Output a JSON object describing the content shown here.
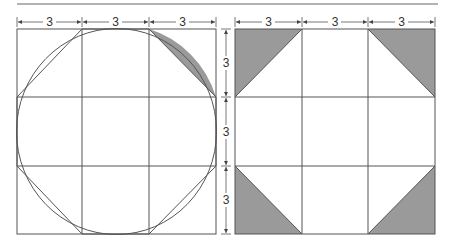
{
  "figure": {
    "colors": {
      "line": "#555555",
      "shade": "#9a9a9a",
      "background": "#ffffff"
    },
    "left_panel": {
      "top_dimensions": [
        "3",
        "3",
        "3"
      ],
      "shaded_region": "circular segment between arc and chord in top-right cell"
    },
    "right_panel": {
      "top_dimensions": [
        "3",
        "3",
        "3"
      ],
      "side_dimensions": [
        "3",
        "3",
        "3"
      ],
      "shaded_region": "four corner right triangles"
    }
  }
}
